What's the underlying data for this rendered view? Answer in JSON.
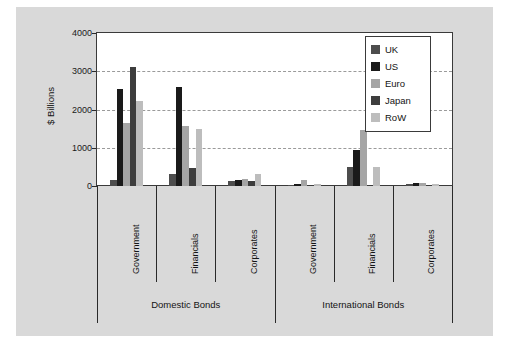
{
  "chart_data": {
    "type": "bar",
    "title": "",
    "xlabel": "",
    "ylabel": "$ Billions",
    "ylim": [
      0,
      4000
    ],
    "yticks": [
      0,
      1000,
      2000,
      3000,
      4000
    ],
    "grid": true,
    "legend_position": "top-right",
    "categories": [
      "Government",
      "Financials",
      "Corporates",
      "Government",
      "Financials",
      "Corporates"
    ],
    "group_labels": [
      "Domestic Bonds",
      "International Bonds"
    ],
    "group_spans": [
      3,
      3
    ],
    "series": [
      {
        "name": "UK",
        "color": "#4d4d4d",
        "values": [
          170,
          320,
          130,
          15,
          510,
          40
        ]
      },
      {
        "name": "US",
        "color": "#1a1a1a",
        "values": [
          2540,
          2600,
          160,
          55,
          950,
          75
        ]
      },
      {
        "name": "Euro",
        "color": "#a5a5a5",
        "values": [
          1660,
          1570,
          180,
          150,
          1470,
          90
        ]
      },
      {
        "name": "Japan",
        "color": "#3d3d3d",
        "values": [
          3100,
          460,
          120,
          10,
          10,
          15
        ]
      },
      {
        "name": "RoW",
        "color": "#bdbdbd",
        "values": [
          2230,
          1490,
          310,
          45,
          500,
          60
        ]
      }
    ]
  },
  "legend": {
    "entries": [
      "UK",
      "US",
      "Euro",
      "Japan",
      "RoW"
    ]
  },
  "axis": {
    "y_label": "$ Billions",
    "y_ticks": [
      "4000",
      "3000",
      "2000",
      "1000",
      "0"
    ]
  }
}
